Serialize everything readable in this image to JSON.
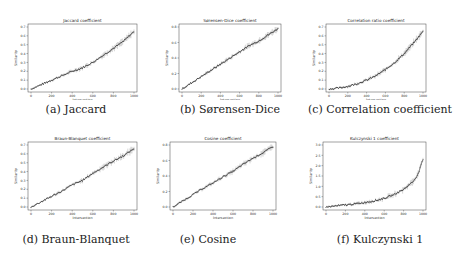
{
  "figure": {
    "captions": [
      "(a) Jaccard",
      "(b) Sørensen-Dice",
      "(c) Correlation coefficient",
      "(d) Braun-Blanquet",
      "(e) Cosine",
      "(f) Kulczynski 1"
    ]
  },
  "chart_data": [
    {
      "type": "line",
      "title": "Jaccard coefficient",
      "xlabel": "Intersection",
      "ylabel": "Similarity",
      "xlim": [
        0,
        1000
      ],
      "ylim": [
        0,
        0.7
      ],
      "xticks": [
        0,
        200,
        400,
        600,
        800,
        1000
      ],
      "yticks": [
        0.0,
        0.1,
        0.2,
        0.3,
        0.4,
        0.5,
        0.6,
        0.7
      ],
      "x": [
        0,
        100,
        200,
        300,
        400,
        500,
        600,
        700,
        800,
        900,
        1000
      ],
      "values": [
        0.0,
        0.05,
        0.1,
        0.15,
        0.2,
        0.24,
        0.3,
        0.38,
        0.46,
        0.54,
        0.65
      ],
      "error_bars": true,
      "caption": "(a) Jaccard"
    },
    {
      "type": "line",
      "title": "Sørensen-Dice coefficient",
      "xlabel": "Intersection",
      "ylabel": "Similarity",
      "xlim": [
        0,
        1000
      ],
      "ylim": [
        0,
        0.8
      ],
      "xticks": [
        0,
        200,
        400,
        600,
        800,
        1000
      ],
      "yticks": [
        0.0,
        0.2,
        0.4,
        0.6,
        0.8
      ],
      "x": [
        0,
        100,
        200,
        300,
        400,
        500,
        600,
        700,
        800,
        900,
        1000
      ],
      "values": [
        0.0,
        0.08,
        0.16,
        0.24,
        0.32,
        0.4,
        0.48,
        0.56,
        0.62,
        0.7,
        0.78
      ],
      "error_bars": true,
      "caption": "(b) Sørensen-Dice"
    },
    {
      "type": "line",
      "title": "Correlation ratio coefficient",
      "xlabel": "Intersection",
      "ylabel": "Similarity",
      "xlim": [
        0,
        1000
      ],
      "ylim": [
        0,
        0.7
      ],
      "xticks": [
        0,
        200,
        400,
        600,
        800,
        1000
      ],
      "yticks": [
        0.0,
        0.1,
        0.2,
        0.3,
        0.4,
        0.5,
        0.6,
        0.7
      ],
      "x": [
        0,
        100,
        200,
        300,
        400,
        500,
        600,
        700,
        800,
        900,
        1000
      ],
      "values": [
        0.0,
        0.01,
        0.03,
        0.06,
        0.1,
        0.15,
        0.22,
        0.3,
        0.4,
        0.52,
        0.65
      ],
      "error_bars": true,
      "caption": "(c) Correlation coefficient"
    },
    {
      "type": "line",
      "title": "Braun-Blanquet coefficient",
      "xlabel": "Intersection",
      "ylabel": "Similarity",
      "xlim": [
        0,
        1000
      ],
      "ylim": [
        0,
        0.7
      ],
      "xticks": [
        0,
        200,
        400,
        600,
        800,
        1000
      ],
      "yticks": [
        0.0,
        0.1,
        0.2,
        0.3,
        0.4,
        0.5,
        0.6,
        0.7
      ],
      "x": [
        0,
        100,
        200,
        300,
        400,
        500,
        600,
        700,
        800,
        900,
        1000
      ],
      "values": [
        0.0,
        0.06,
        0.12,
        0.18,
        0.25,
        0.3,
        0.38,
        0.45,
        0.52,
        0.58,
        0.66
      ],
      "error_bars": true,
      "caption": "(d) Braun-Blanquet"
    },
    {
      "type": "line",
      "title": "Cosine coefficient",
      "xlabel": "Intersection",
      "ylabel": "Similarity",
      "xlim": [
        0,
        1000
      ],
      "ylim": [
        0,
        0.8
      ],
      "xticks": [
        0,
        200,
        400,
        600,
        800,
        1000
      ],
      "yticks": [
        0.0,
        0.2,
        0.4,
        0.6,
        0.8
      ],
      "x": [
        0,
        100,
        200,
        300,
        400,
        500,
        600,
        700,
        800,
        900,
        1000
      ],
      "values": [
        0.0,
        0.08,
        0.16,
        0.24,
        0.31,
        0.39,
        0.46,
        0.55,
        0.63,
        0.7,
        0.78
      ],
      "error_bars": true,
      "caption": "(e) Cosine"
    },
    {
      "type": "line",
      "title": "Kulczynski 1 coefficient",
      "xlabel": "Intersection",
      "ylabel": "Similarity",
      "xlim": [
        0,
        1000
      ],
      "ylim": [
        0,
        3.0
      ],
      "xticks": [
        0,
        200,
        400,
        600,
        800,
        1000
      ],
      "yticks": [
        0.0,
        0.5,
        1.0,
        1.5,
        2.0,
        2.5,
        3.0
      ],
      "x": [
        0,
        100,
        200,
        300,
        400,
        500,
        600,
        700,
        800,
        900,
        950,
        1000
      ],
      "values": [
        0.0,
        0.05,
        0.1,
        0.15,
        0.22,
        0.3,
        0.42,
        0.6,
        0.85,
        1.25,
        1.6,
        2.3
      ],
      "error_bars": true,
      "caption": "(f) Kulczynski 1"
    }
  ]
}
